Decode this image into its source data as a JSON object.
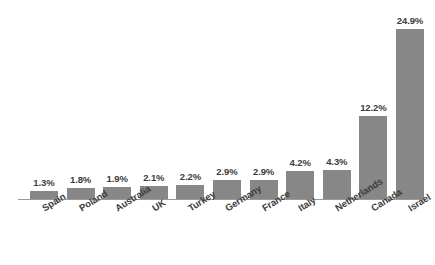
{
  "chart_data": {
    "type": "bar",
    "title": "",
    "subtitle": "",
    "xlabel": "",
    "ylabel": "",
    "ylim": [
      0,
      24.9
    ],
    "grid": false,
    "legend": false,
    "axis": {
      "baseline_visible": true,
      "y_axis_visible": false,
      "y_ticks": []
    },
    "orientation": "vertical",
    "sorted": "ascending",
    "bar_color": "#878787",
    "label_color": "#3c3c3c",
    "background_color": "#ffffff",
    "value_suffix": "%",
    "categories": [
      "Spain",
      "Poland",
      "Australia",
      "UK",
      "Turkey",
      "Germany",
      "France",
      "Italy",
      "Netherlands",
      "Canada",
      "Israel"
    ],
    "values": [
      1.3,
      1.8,
      1.9,
      2.1,
      2.2,
      2.9,
      2.9,
      4.2,
      4.3,
      12.2,
      24.9
    ],
    "value_labels": [
      "1.3%",
      "1.8%",
      "1.9%",
      "2.1%",
      "2.2%",
      "2.9%",
      "2.9%",
      "4.2%",
      "4.3%",
      "12.2%",
      "24.9%"
    ],
    "points": [
      {
        "category": "Spain",
        "value": 1.3,
        "label": "1.3%"
      },
      {
        "category": "Poland",
        "value": 1.8,
        "label": "1.8%"
      },
      {
        "category": "Australia",
        "value": 1.9,
        "label": "1.9%"
      },
      {
        "category": "UK",
        "value": 2.1,
        "label": "2.1%"
      },
      {
        "category": "Turkey",
        "value": 2.2,
        "label": "2.2%"
      },
      {
        "category": "Germany",
        "value": 2.9,
        "label": "2.9%"
      },
      {
        "category": "France",
        "value": 2.9,
        "label": "2.9%"
      },
      {
        "category": "Italy",
        "value": 4.2,
        "label": "4.2%"
      },
      {
        "category": "Netherlands",
        "value": 4.3,
        "label": "4.3%"
      },
      {
        "category": "Canada",
        "value": 12.2,
        "label": "12.2%"
      },
      {
        "category": "Israel",
        "value": 24.9,
        "label": "24.9%"
      }
    ]
  },
  "layout": {
    "bar_width_px": 28,
    "bar_pitch_px": 36.6,
    "first_bar_left_px": 30,
    "baseline_y_px": 199,
    "px_per_unit": 6.87,
    "tick_rotation_deg": -32
  }
}
